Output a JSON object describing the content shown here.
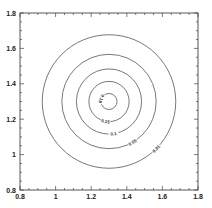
{
  "chart_data": {
    "type": "contour",
    "title": "",
    "xlabel": "",
    "ylabel": "",
    "xlim": [
      0.8,
      1.8
    ],
    "ylim": [
      0.8,
      1.8
    ],
    "grid": false,
    "legend": null,
    "x_ticks": [
      "0.8",
      "1",
      "1.2",
      "1.4",
      "1.6",
      "1.8"
    ],
    "y_ticks": [
      "0.8",
      "1",
      "1.2",
      "1.4",
      "1.6",
      "1.8"
    ],
    "x_tick_values": [
      0.8,
      1.0,
      1.2,
      1.4,
      1.6,
      1.8
    ],
    "y_tick_values": [
      0.8,
      1.0,
      1.2,
      1.4,
      1.6,
      1.8
    ],
    "minor_tick_step": 0.05,
    "center": [
      1.3,
      1.3
    ],
    "contours": [
      {
        "level": "0.19",
        "radius": 0.045
      },
      {
        "level": "0.15",
        "radius": 0.113
      },
      {
        "level": "0.1",
        "radius": 0.183
      },
      {
        "level": "0.05",
        "radius": 0.265
      },
      {
        "level": "0.01",
        "radius": 0.375
      }
    ],
    "line_color": "#555555"
  }
}
